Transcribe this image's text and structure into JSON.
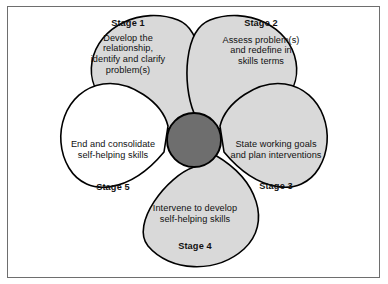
{
  "figure": {
    "type": "cycle-petal-diagram",
    "petal_count": 5,
    "hub_label": "",
    "colors": {
      "petal_fill": "#d9d9d9",
      "petal_fill_empty": "#ffffff",
      "petal_stroke": "#000000",
      "hub_fill": "#6e6e6e",
      "hub_stroke": "#000000",
      "text": "#111111",
      "frame": "#6e6e6e",
      "background": "#ffffff"
    },
    "stages": [
      {
        "id": "stage-1",
        "title": "Stage 1",
        "description_lines": [
          "Develop the",
          "relationship,",
          "identify and clarify",
          "problem(s)"
        ],
        "filled": true
      },
      {
        "id": "stage-2",
        "title": "Stage 2",
        "description_lines": [
          "Assess problem(s)",
          "and redefine in",
          "skills terms"
        ],
        "filled": true
      },
      {
        "id": "stage-3",
        "title": "Stage 3",
        "description_lines": [
          "State working goals",
          "and plan interventions"
        ],
        "filled": true
      },
      {
        "id": "stage-4",
        "title": "Stage 4",
        "description_lines": [
          "Intervene to develop",
          "self-helping skills"
        ],
        "filled": true
      },
      {
        "id": "stage-5",
        "title": "Stage 5",
        "description_lines": [
          "End and consolidate",
          "self-helping skills"
        ],
        "filled": false
      }
    ]
  }
}
